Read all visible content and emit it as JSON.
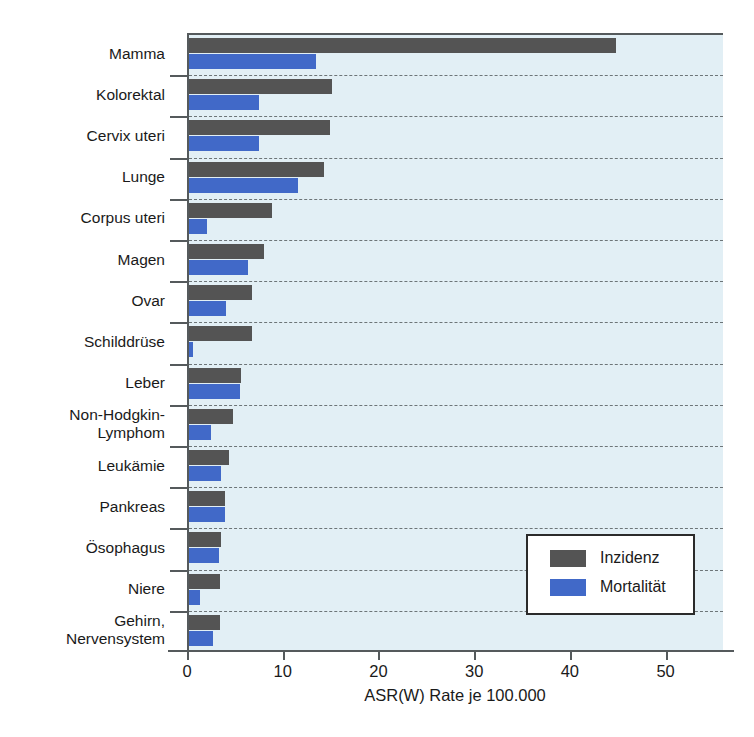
{
  "chart_data": {
    "type": "bar",
    "orientation": "horizontal",
    "title": "",
    "subtitle": "",
    "xlabel": "ASR(W) Rate je 100.000",
    "ylabel": "",
    "xlim": [
      0,
      56
    ],
    "xticks": [
      0,
      10,
      20,
      30,
      40,
      50
    ],
    "xtick_labels": [
      "0",
      "10",
      "20",
      "30",
      "40",
      "50"
    ],
    "grid": "horizontal-dashed",
    "legend_position": "bottom-right",
    "categories": [
      "Mamma",
      "Kolorektal",
      "Cervix uteri",
      "Lunge",
      "Corpus uteri",
      "Magen",
      "Ovar",
      "Schilddrüse",
      "Leber",
      "Non-Hodgkin-\nLymphom",
      "Leukämie",
      "Pankreas",
      "Ösophagus",
      "Niere",
      "Gehirn,\nNervensystem"
    ],
    "series": [
      {
        "name": "Inzidenz",
        "color": "#545454",
        "values": [
          44.6,
          14.9,
          14.7,
          14.1,
          8.7,
          7.8,
          6.6,
          6.6,
          5.4,
          4.6,
          4.2,
          3.8,
          3.3,
          3.2,
          3.2
        ]
      },
      {
        "name": "Mortalität",
        "color": "#4169c8",
        "values": [
          13.3,
          7.3,
          7.3,
          11.4,
          1.9,
          6.2,
          3.9,
          0.4,
          5.3,
          2.3,
          3.3,
          3.8,
          3.1,
          1.2,
          2.5
        ]
      }
    ]
  },
  "legend": {
    "items": [
      {
        "label": "Inzidenz",
        "color": "#545454"
      },
      {
        "label": "Mortalität",
        "color": "#4169c8"
      }
    ]
  },
  "colors": {
    "plot_background": "#e2eff5",
    "axis": "#555a5c",
    "gridline": "#6d7578",
    "incidence": "#545454",
    "mortality": "#4169c8"
  }
}
